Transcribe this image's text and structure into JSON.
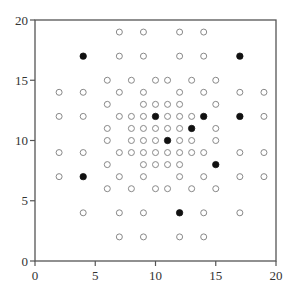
{
  "chart_data": {
    "type": "scatter",
    "title": "",
    "xlabel": "",
    "ylabel": "",
    "xlim": [
      0,
      20
    ],
    "ylim": [
      0,
      20
    ],
    "xticks": [
      0,
      5,
      10,
      15,
      20
    ],
    "yticks": [
      0,
      5,
      10,
      15,
      20
    ],
    "grid": false,
    "legend": null,
    "colors": {
      "axis": "#555555",
      "open_marker": "#888888",
      "filled_marker": "#111111"
    },
    "series": [
      {
        "name": "open",
        "marker": "open-circle",
        "points": [
          [
            7,
            19
          ],
          [
            9,
            19
          ],
          [
            12,
            19
          ],
          [
            14,
            19
          ],
          [
            7,
            17
          ],
          [
            9,
            17
          ],
          [
            12,
            17
          ],
          [
            14,
            17
          ],
          [
            6,
            15
          ],
          [
            8,
            15
          ],
          [
            10,
            15
          ],
          [
            11,
            15
          ],
          [
            13,
            15
          ],
          [
            15,
            15
          ],
          [
            2,
            14
          ],
          [
            4,
            14
          ],
          [
            7,
            14
          ],
          [
            9,
            14
          ],
          [
            12,
            14
          ],
          [
            14,
            14
          ],
          [
            17,
            14
          ],
          [
            19,
            14
          ],
          [
            6,
            13
          ],
          [
            9,
            13
          ],
          [
            10,
            13
          ],
          [
            11,
            13
          ],
          [
            12,
            13
          ],
          [
            15,
            13
          ],
          [
            2,
            12
          ],
          [
            4,
            12
          ],
          [
            7,
            12
          ],
          [
            8,
            12
          ],
          [
            9,
            12
          ],
          [
            11,
            12
          ],
          [
            12,
            12
          ],
          [
            13,
            12
          ],
          [
            19,
            12
          ],
          [
            6,
            11
          ],
          [
            8,
            11
          ],
          [
            9,
            11
          ],
          [
            10,
            11
          ],
          [
            11,
            11
          ],
          [
            12,
            11
          ],
          [
            15,
            11
          ],
          [
            6,
            10
          ],
          [
            8,
            10
          ],
          [
            9,
            10
          ],
          [
            10,
            10
          ],
          [
            12,
            10
          ],
          [
            13,
            10
          ],
          [
            15,
            10
          ],
          [
            2,
            9
          ],
          [
            4,
            9
          ],
          [
            7,
            9
          ],
          [
            8,
            9
          ],
          [
            9,
            9
          ],
          [
            10,
            9
          ],
          [
            11,
            9
          ],
          [
            12,
            9
          ],
          [
            13,
            9
          ],
          [
            14,
            9
          ],
          [
            17,
            9
          ],
          [
            19,
            9
          ],
          [
            6,
            8
          ],
          [
            9,
            8
          ],
          [
            10,
            8
          ],
          [
            11,
            8
          ],
          [
            12,
            8
          ],
          [
            2,
            7
          ],
          [
            7,
            7
          ],
          [
            9,
            7
          ],
          [
            12,
            7
          ],
          [
            14,
            7
          ],
          [
            17,
            7
          ],
          [
            19,
            7
          ],
          [
            6,
            6
          ],
          [
            8,
            6
          ],
          [
            10,
            6
          ],
          [
            11,
            6
          ],
          [
            13,
            6
          ],
          [
            15,
            6
          ],
          [
            4,
            4
          ],
          [
            7,
            4
          ],
          [
            9,
            4
          ],
          [
            14,
            4
          ],
          [
            17,
            4
          ],
          [
            7,
            2
          ],
          [
            9,
            2
          ],
          [
            12,
            2
          ],
          [
            14,
            2
          ]
        ]
      },
      {
        "name": "filled",
        "marker": "filled-circle",
        "points": [
          [
            4,
            17
          ],
          [
            17,
            17
          ],
          [
            10,
            12
          ],
          [
            14,
            12
          ],
          [
            17,
            12
          ],
          [
            13,
            11
          ],
          [
            11,
            10
          ],
          [
            15,
            8
          ],
          [
            4,
            7
          ],
          [
            12,
            4
          ]
        ]
      }
    ]
  }
}
